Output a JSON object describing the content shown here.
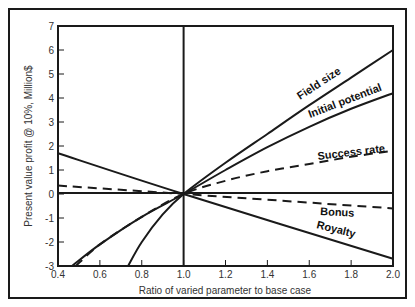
{
  "chart_data": {
    "type": "line",
    "title": "",
    "xlabel": "Ratio of varied parameter to base case",
    "ylabel": "Present value profit @ 10%, Million$",
    "xlim": [
      0.4,
      2.0
    ],
    "ylim": [
      -3,
      7
    ],
    "x_ticks": [
      "0.4",
      "0.6",
      "0.8",
      "1.0",
      "1.2",
      "1.4",
      "1.6",
      "1.8",
      "2.0"
    ],
    "y_ticks": [
      "-3",
      "-2",
      "-1",
      "0",
      "1",
      "2",
      "3",
      "4",
      "5",
      "6",
      "7"
    ],
    "grid": false,
    "legend": "inline labels on curves",
    "series": [
      {
        "name": "Field size",
        "style": "solid",
        "points": [
          [
            0.735,
            -3.0
          ],
          [
            0.8,
            -2.0
          ],
          [
            0.9,
            -0.85
          ],
          [
            1.0,
            0.0
          ],
          [
            1.2,
            1.3
          ],
          [
            1.4,
            2.5
          ],
          [
            1.6,
            3.7
          ],
          [
            1.8,
            4.85
          ],
          [
            2.0,
            6.0
          ]
        ]
      },
      {
        "name": "Initial potential",
        "style": "solid",
        "points": [
          [
            0.467,
            -3.0
          ],
          [
            0.6,
            -2.1
          ],
          [
            0.8,
            -0.95
          ],
          [
            1.0,
            0.0
          ],
          [
            1.2,
            1.0
          ],
          [
            1.4,
            1.95
          ],
          [
            1.6,
            2.8
          ],
          [
            1.8,
            3.55
          ],
          [
            2.0,
            4.2
          ]
        ]
      },
      {
        "name": "Success rate",
        "style": "dashed",
        "points": [
          [
            0.485,
            -3.0
          ],
          [
            0.6,
            -2.1
          ],
          [
            0.8,
            -0.95
          ],
          [
            1.0,
            0.0
          ],
          [
            1.2,
            0.55
          ],
          [
            1.4,
            0.95
          ],
          [
            1.6,
            1.25
          ],
          [
            1.8,
            1.55
          ],
          [
            2.0,
            1.8
          ]
        ]
      },
      {
        "name": "Bonus",
        "style": "dashed",
        "points": [
          [
            0.4,
            0.35
          ],
          [
            1.0,
            0.0
          ],
          [
            2.0,
            -0.6
          ]
        ]
      },
      {
        "name": "Royalty",
        "style": "solid",
        "points": [
          [
            0.4,
            1.7
          ],
          [
            1.0,
            0.0
          ],
          [
            2.0,
            -2.7
          ]
        ]
      }
    ],
    "reference_lines": [
      {
        "orientation": "horizontal",
        "value": 0
      },
      {
        "orientation": "vertical",
        "value": 1.0
      }
    ]
  },
  "labels": {
    "field_size": "Field size",
    "initial_potential": "Initial potential",
    "success_rate": "Success rate",
    "bonus": "Bonus",
    "royalty": "Royalty",
    "xlabel": "Ratio of varied parameter to base case",
    "ylabel": "Present value profit @ 10%, Million$"
  },
  "ticks": {
    "x": [
      "0.4",
      "0.6",
      "0.8",
      "1.0",
      "1.2",
      "1.4",
      "1.6",
      "1.8",
      "2.0"
    ],
    "y": [
      "-3",
      "-2",
      "-1",
      "0",
      "1",
      "2",
      "3",
      "4",
      "5",
      "6",
      "7"
    ]
  }
}
